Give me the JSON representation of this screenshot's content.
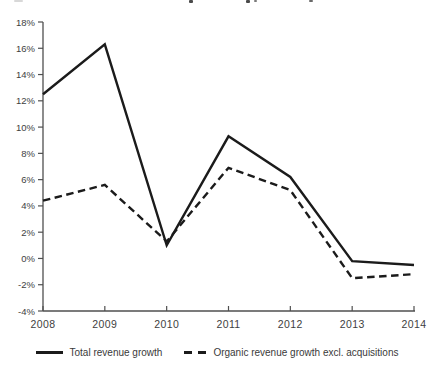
{
  "chart_data": {
    "type": "line",
    "x": [
      2008,
      2009,
      2010,
      2011,
      2012,
      2013,
      2014
    ],
    "xtick_labels": [
      "2008",
      "2009",
      "2010",
      "2011",
      "2012",
      "2013",
      "2014"
    ],
    "series": [
      {
        "name": "Total revenue growth",
        "style": "solid",
        "values": [
          12.5,
          16.3,
          1.0,
          9.3,
          6.2,
          -0.2,
          -0.5
        ]
      },
      {
        "name": "Organic revenue growth excl. acquisitions",
        "style": "dashed",
        "values": [
          4.4,
          5.6,
          1.3,
          6.9,
          5.2,
          -1.5,
          -1.2
        ]
      }
    ],
    "ylim": [
      -4,
      18
    ],
    "ytick_step": 2,
    "ytick_labels": [
      "18%",
      "16%",
      "14%",
      "12%",
      "10%",
      "8%",
      "6%",
      "4%",
      "2%",
      "0%",
      "-2%",
      "-4%"
    ],
    "grid": false,
    "legend_position": "bottom",
    "line_color": "#1b1b1b",
    "axis_color": "#4f4f4f",
    "label_color": "#3e3e3e"
  }
}
